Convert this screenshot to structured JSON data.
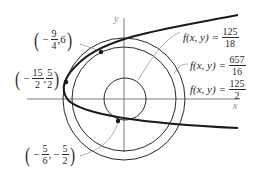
{
  "axes": {
    "x_label": "x",
    "y_label": "y"
  },
  "points": [
    {
      "label_sign_x": "−",
      "x_num": "9",
      "x_den": "4",
      "y_text": "6",
      "coords": "(-9/4, 6)"
    },
    {
      "label_sign_x": "−",
      "x_num": "15",
      "x_den": "2",
      "y_num": "5",
      "y_den": "2",
      "coords": "(-15/2, 5/2)"
    },
    {
      "label_sign_x": "−",
      "x_num": "5",
      "x_den": "6",
      "label_sign_y": "−",
      "y_num": "5",
      "y_den": "2",
      "coords": "(-5/6, -5/2)"
    }
  ],
  "level_curves": [
    {
      "lhs": "f(x, y) =",
      "num": "125",
      "den": "18"
    },
    {
      "lhs": "f(x, y) =",
      "num": "657",
      "den": "16"
    },
    {
      "lhs": "f(x, y) =",
      "num": "125",
      "den": "2"
    }
  ],
  "colors": {
    "curve": "#1a1a1a",
    "circle": "#2a2a2a",
    "axis": "#7a7a7a"
  }
}
